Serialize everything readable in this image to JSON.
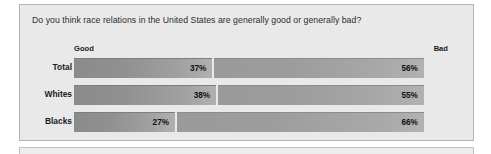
{
  "chart_data": {
    "type": "bar",
    "title": "Do you think race relations in the United States are generally good or generally bad?",
    "subtitle": "",
    "xlabel": "",
    "ylabel": "",
    "orientation": "horizontal",
    "stacked": false,
    "grid": false,
    "legend_position": "top",
    "xlim": [
      0,
      100
    ],
    "categories": [
      "Total",
      "Whites",
      "Blacks"
    ],
    "series": [
      {
        "name": "Good",
        "values": [
          37,
          38,
          27
        ]
      },
      {
        "name": "Bad",
        "values": [
          56,
          55,
          66
        ]
      }
    ],
    "value_labels": {
      "Good": [
        "37%",
        "38%",
        "27%"
      ],
      "Bad": [
        "56%",
        "55%",
        "66%"
      ]
    },
    "annotations": []
  },
  "panel": {
    "question": "Do you think race relations in the United States are generally good or generally bad?",
    "header_good": "Good",
    "header_bad": "Bad",
    "rows": [
      {
        "label": "Total",
        "good_label": "37%",
        "bad_label": "56%",
        "good_value": 37,
        "bad_value": 56
      },
      {
        "label": "Whites",
        "good_label": "38%",
        "bad_label": "55%",
        "good_value": 38,
        "bad_value": 55
      },
      {
        "label": "Blacks",
        "good_label": "27%",
        "bad_label": "66%",
        "good_value": 27,
        "bad_value": 66
      }
    ]
  },
  "colors": {
    "panel_background": "#e9e9e9",
    "panel_border": "#b4b4b4",
    "bar_good_dark": "#8b8b8b",
    "bar_good_light": "#b0b0b0",
    "bar_bad_dark": "#9a9a9a",
    "bar_bad_light": "#b2b2b2",
    "text": "#1a1a1a",
    "page_background": "#ffffff"
  }
}
